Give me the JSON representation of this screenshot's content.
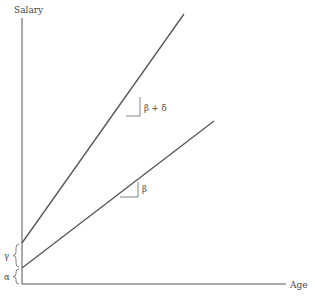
{
  "axes": {
    "y_label": "Salary",
    "x_label": "Age"
  },
  "lines": [
    {
      "name": "upper",
      "start": [
        22,
        243
      ],
      "end": [
        184,
        14
      ]
    },
    {
      "name": "lower",
      "start": [
        22,
        268
      ],
      "end": [
        214,
        121
      ]
    }
  ],
  "slope_labels": {
    "upper": "β + δ",
    "lower": "β"
  },
  "intercept_labels": {
    "gamma": "γ",
    "alpha": "α"
  },
  "colors": {
    "line": "#555555",
    "axis": "#555555",
    "text": "#444444"
  }
}
